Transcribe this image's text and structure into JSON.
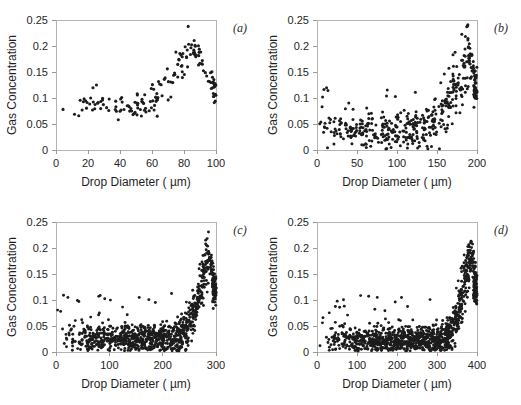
{
  "figure": {
    "background": "#ffffff",
    "point_color": "#1c1c1c",
    "axis_color": "#b4b4b4",
    "layout": "2x2 grid of scatter panels"
  },
  "chart_data": [
    {
      "type": "scatter",
      "panel_label": "(a)",
      "title": "",
      "xlabel": "Drop Diameter ( µm)",
      "ylabel": "Gas Concentration",
      "xlim": [
        0,
        100
      ],
      "ylim": [
        0,
        0.25
      ],
      "xticks": [
        0,
        20,
        40,
        60,
        80,
        100
      ],
      "xticklabels": [
        "0",
        "20",
        "40",
        "60",
        "80",
        "100"
      ],
      "yticks": [
        0,
        0.05,
        0.1,
        0.15,
        0.2,
        0.25
      ],
      "yticklabels": [
        "0",
        "0.05",
        "0.1",
        "0.15",
        "0.2",
        "0.25"
      ],
      "grid": false,
      "legend": "none",
      "n_points": 155,
      "marker_size": 1.55,
      "seed": 11,
      "profile": {
        "baseline": 0.086,
        "baseline_scatter": 0.011,
        "rise_start": 42,
        "peak_x": 84,
        "peak_y": 0.197,
        "rise_scatter": 0.012,
        "tail_y": 0.118,
        "tail_scatter": 0.013,
        "x_start": 3,
        "density_bias": 0.55
      },
      "description": "Gas concentration near 0.08-0.09 for drops below 40 um, rising gradually to a sharp peak of about 0.20 at 84 um, then dropping back to about 0.115 at 100 um."
    },
    {
      "type": "scatter",
      "panel_label": "(b)",
      "title": "",
      "xlabel": "Drop Diameter ( µm)",
      "ylabel": "Gas Concentration",
      "xlim": [
        0,
        200
      ],
      "ylim": [
        0,
        0.25
      ],
      "xticks": [
        0,
        50,
        100,
        150,
        200
      ],
      "xticklabels": [
        "0",
        "50",
        "100",
        "150",
        "200"
      ],
      "yticks": [
        0,
        0.05,
        0.1,
        0.15,
        0.2,
        0.25
      ],
      "yticklabels": [
        "0",
        "0.05",
        "0.1",
        "0.15",
        "0.2",
        "0.25"
      ],
      "grid": false,
      "legend": "none",
      "n_points": 420,
      "marker_size": 1.5,
      "seed": 23,
      "profile": {
        "baseline": 0.042,
        "baseline_scatter": 0.018,
        "rise_start": 120,
        "peak_x": 190,
        "peak_y": 0.185,
        "rise_scatter": 0.016,
        "tail_y": 0.122,
        "tail_scatter": 0.016,
        "x_start": 2,
        "density_bias": 0.62,
        "outlier_count": 12,
        "outlier_max": 0.122
      },
      "description": "Broad scatter around 0.04 out to 120 um with occasional points near 0.10-0.12, then a steep exponential rise to about 0.20 near 190 um and a cluster near 0.12 at 200 um."
    },
    {
      "type": "scatter",
      "panel_label": "(c)",
      "title": "",
      "xlabel": "Drop Diameter ( µm)",
      "ylabel": "Gas Concentration",
      "xlim": [
        0,
        300
      ],
      "ylim": [
        0,
        0.25
      ],
      "xticks": [
        0,
        100,
        200,
        300
      ],
      "xticklabels": [
        "0",
        "100",
        "200",
        "300"
      ],
      "yticks": [
        0,
        0.05,
        0.1,
        0.15,
        0.2,
        0.25
      ],
      "yticklabels": [
        "0",
        "0.05",
        "0.1",
        "0.15",
        "0.2",
        "0.25"
      ],
      "grid": false,
      "legend": "none",
      "n_points": 900,
      "marker_size": 1.45,
      "seed": 37,
      "profile": {
        "baseline": 0.026,
        "baseline_scatter": 0.014,
        "rise_start": 215,
        "peak_x": 286,
        "peak_y": 0.19,
        "rise_scatter": 0.015,
        "tail_y": 0.118,
        "tail_scatter": 0.013,
        "x_start": 2,
        "density_bias": 0.6,
        "outlier_count": 26,
        "outlier_max": 0.118
      },
      "description": "Dense band of points between 0.005 and 0.05 across most diameters, sparse outliers up to 0.12, and a near-vertical spike to about 0.19 just before 300 um."
    },
    {
      "type": "scatter",
      "panel_label": "(d)",
      "title": "",
      "xlabel": "Drop Diameter ( µm)",
      "ylabel": "Gas Concentration",
      "xlim": [
        0,
        400
      ],
      "ylim": [
        0,
        0.25
      ],
      "xticks": [
        0,
        100,
        200,
        300,
        400
      ],
      "xticklabels": [
        "0",
        "100",
        "200",
        "300",
        "400"
      ],
      "yticks": [
        0,
        0.05,
        0.1,
        0.15,
        0.2,
        0.25
      ],
      "yticklabels": [
        "0",
        "0.05",
        "0.1",
        "0.15",
        "0.2",
        "0.25"
      ],
      "grid": false,
      "legend": "none",
      "n_points": 1050,
      "marker_size": 1.45,
      "seed": 53,
      "profile": {
        "baseline": 0.023,
        "baseline_scatter": 0.013,
        "rise_start": 305,
        "peak_x": 385,
        "peak_y": 0.2,
        "rise_scatter": 0.015,
        "tail_y": 0.12,
        "tail_scatter": 0.014,
        "x_start": 2,
        "density_bias": 0.58,
        "outlier_count": 28,
        "outlier_max": 0.112
      },
      "description": "Very dense low band near 0.02 extending to about 350 um with scattered outliers near 0.10, then an abrupt vertical rise to roughly 0.20 at 385 um."
    }
  ]
}
